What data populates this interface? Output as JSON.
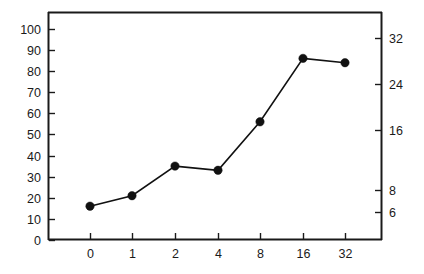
{
  "chart_data": {
    "type": "line",
    "title": "",
    "subtitle": "",
    "xlabel": "",
    "ylabel": "",
    "y2label": "",
    "grid": false,
    "legend": null,
    "legend_position": "none",
    "x_scale": "categorical",
    "categories": [
      "0",
      "1",
      "2",
      "4",
      "8",
      "16",
      "32"
    ],
    "xtick_labels": [
      "0",
      "1",
      "2",
      "4",
      "8",
      "16",
      "32"
    ],
    "ytick_labels": [
      "0",
      "10",
      "20",
      "30",
      "40",
      "50",
      "60",
      "70",
      "80",
      "90",
      "100"
    ],
    "ytick_values": [
      0,
      10,
      20,
      30,
      40,
      50,
      60,
      70,
      80,
      90,
      100
    ],
    "ylim": [
      0,
      108
    ],
    "y2tick_labels": [
      "6",
      "8",
      "16",
      "24",
      "32"
    ],
    "y2tick_values": [
      6,
      8,
      16,
      24,
      32
    ],
    "y2tick_positions": [
      212,
      190,
      130,
      84,
      38
    ],
    "series": [
      {
        "name": "series-1",
        "marker": "filled-circle",
        "color": "#111111",
        "values": [
          16,
          21,
          35,
          33,
          56,
          86,
          84
        ]
      }
    ],
    "colors": {
      "line": "#111111",
      "marker": "#111111",
      "axis": "#1a1a1a",
      "text": "#1a1a1a",
      "background": "#ffffff"
    },
    "annotations": []
  },
  "geometry": {
    "plot_left": 48,
    "plot_right": 382,
    "plot_top": 12,
    "plot_bottom": 240,
    "x_positions": [
      90,
      132,
      175,
      218,
      260,
      303,
      345
    ],
    "y_value_min": 0,
    "y_value_max": 108
  }
}
